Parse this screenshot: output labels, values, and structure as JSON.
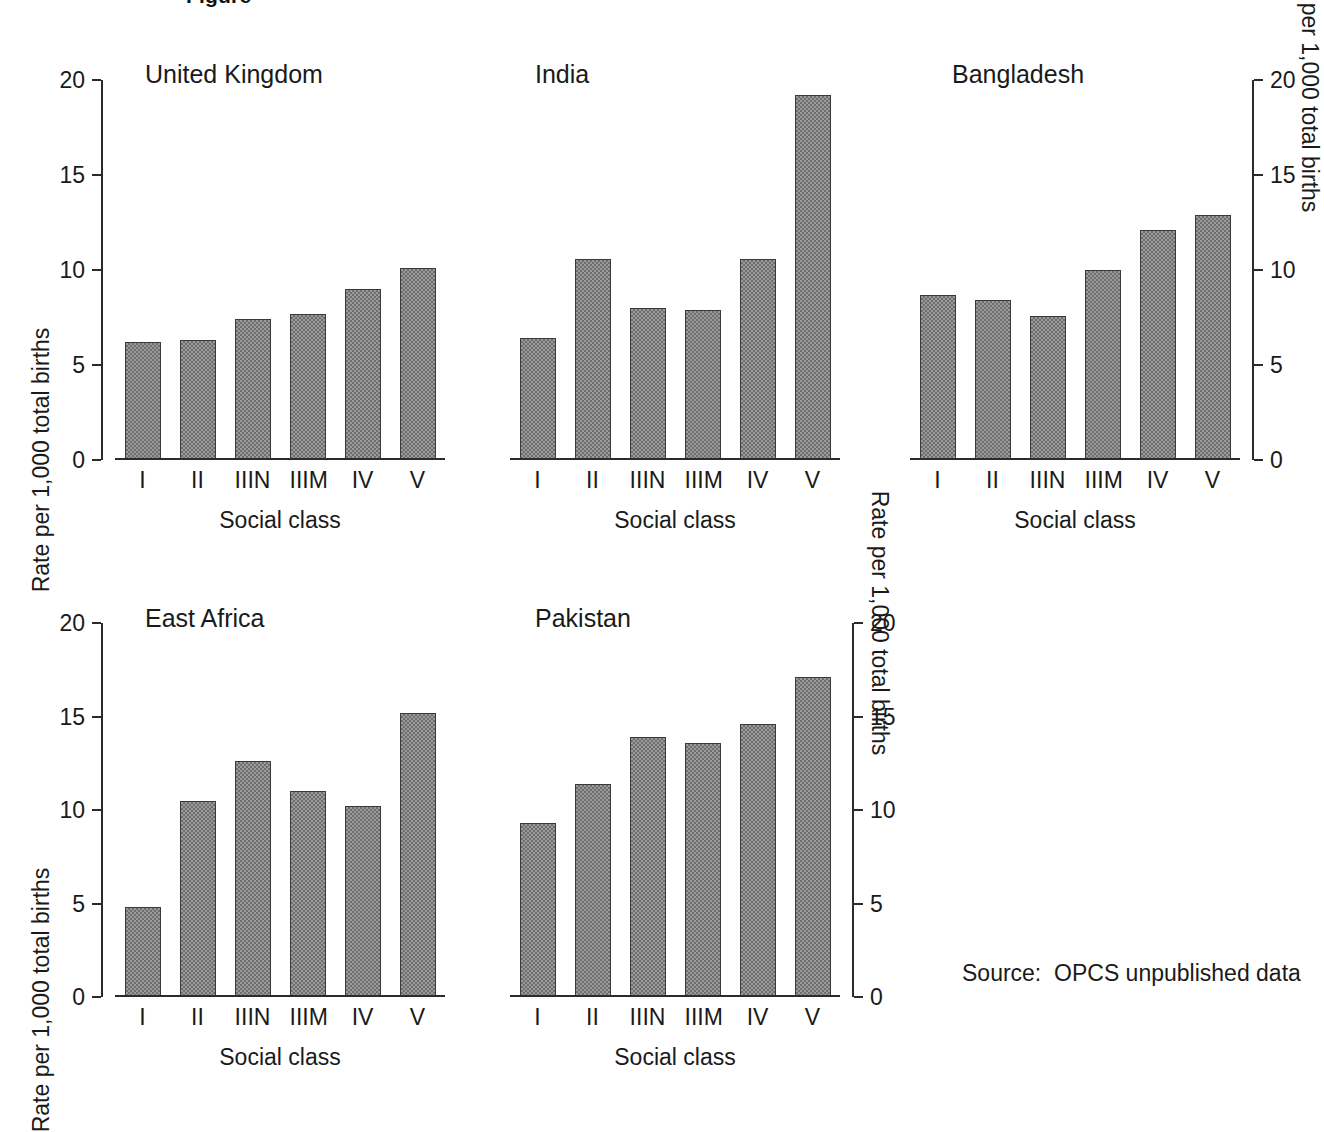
{
  "clipped_heading": "Figure",
  "source_note": "Source:  OPCS unpublished data",
  "common": {
    "xlabel": "Social class",
    "ylabel": "Rate per 1,000 total births",
    "categories": [
      "I",
      "II",
      "IIIN",
      "IIIM",
      "IV",
      "V"
    ],
    "ticks": [
      "0",
      "5",
      "10",
      "15",
      "20"
    ]
  },
  "chart_data": [
    {
      "type": "bar",
      "title": "United Kingdom",
      "categories": [
        "I",
        "II",
        "IIIN",
        "IIIM",
        "IV",
        "V"
      ],
      "values": [
        6.2,
        6.3,
        7.4,
        7.7,
        9.0,
        10.1
      ],
      "xlabel": "Social class",
      "ylabel": "Rate per 1,000 total births",
      "ylim": [
        0,
        20
      ],
      "yticks": [
        0,
        5,
        10,
        15,
        20
      ],
      "axis_side": "left",
      "grid": false,
      "legend": "none"
    },
    {
      "type": "bar",
      "title": "India",
      "categories": [
        "I",
        "II",
        "IIIN",
        "IIIM",
        "IV",
        "V"
      ],
      "values": [
        6.4,
        10.6,
        8.0,
        7.9,
        10.6,
        19.2
      ],
      "xlabel": "Social class",
      "ylabel": "",
      "ylim": [
        0,
        20
      ],
      "yticks": [],
      "axis_side": "none",
      "grid": false,
      "legend": "none"
    },
    {
      "type": "bar",
      "title": "Bangladesh",
      "categories": [
        "I",
        "II",
        "IIIN",
        "IIIM",
        "IV",
        "V"
      ],
      "values": [
        8.7,
        8.4,
        7.6,
        10.0,
        12.1,
        12.9
      ],
      "xlabel": "Social class",
      "ylabel": "Rate per 1,000 total births",
      "ylim": [
        0,
        20
      ],
      "yticks": [
        0,
        5,
        10,
        15,
        20
      ],
      "axis_side": "right",
      "grid": false,
      "legend": "none"
    },
    {
      "type": "bar",
      "title": "East Africa",
      "categories": [
        "I",
        "II",
        "IIIN",
        "IIIM",
        "IV",
        "V"
      ],
      "values": [
        4.8,
        10.5,
        12.6,
        11.0,
        10.2,
        15.2
      ],
      "xlabel": "Social class",
      "ylabel": "Rate per 1,000 total births",
      "ylim": [
        0,
        20
      ],
      "yticks": [
        0,
        5,
        10,
        15,
        20
      ],
      "axis_side": "left",
      "grid": false,
      "legend": "none"
    },
    {
      "type": "bar",
      "title": "Pakistan",
      "categories": [
        "I",
        "II",
        "IIIN",
        "IIIM",
        "IV",
        "V"
      ],
      "values": [
        9.3,
        11.4,
        13.9,
        13.6,
        14.6,
        17.1
      ],
      "xlabel": "Social class",
      "ylabel": "Rate per 1,000 total births",
      "ylim": [
        0,
        20
      ],
      "yticks": [
        0,
        5,
        10,
        15,
        20
      ],
      "axis_side": "right",
      "grid": false,
      "legend": "none"
    }
  ]
}
